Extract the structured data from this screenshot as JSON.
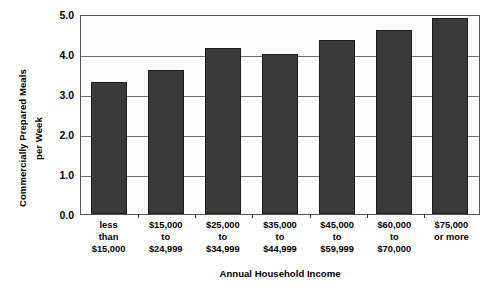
{
  "chart_data": {
    "type": "bar",
    "title": "",
    "xlabel": "Annual Household Income",
    "ylabel": "Commercially Prepared Meals per Week",
    "ylabel_lines": [
      "Commercially Prepared",
      "Meals per Week"
    ],
    "ylabel_line1": "Commercially Prepared Meals",
    "ylabel_line2": "per Week",
    "ylim": [
      0.0,
      5.0
    ],
    "yticks": [
      "0.0",
      "1.0",
      "2.0",
      "3.0",
      "4.0",
      "5.0"
    ],
    "ytick_values": [
      0.0,
      1.0,
      2.0,
      3.0,
      4.0,
      5.0
    ],
    "grid": true,
    "legend": "none",
    "bar_color": "#3a3a3a",
    "categories": [
      "less than $15,000",
      "$15,000 to $24,999",
      "$25,000 to $34,999",
      "$35,000 to $44,999",
      "$45,000 to $59,999",
      "$60,000 to $70,000",
      "$75,000 or more"
    ],
    "category_lines": [
      [
        "less",
        "than",
        "$15,000"
      ],
      [
        "$15,000",
        "to",
        "$24,999"
      ],
      [
        "$25,000",
        "to",
        "$34,999"
      ],
      [
        "$35,000",
        "to",
        "$44,999"
      ],
      [
        "$45,000",
        "to",
        "$59,999"
      ],
      [
        "$60,000",
        "to",
        "$70,000"
      ],
      [
        "$75,000",
        "or more",
        ""
      ]
    ],
    "values": [
      3.3,
      3.6,
      4.15,
      4.0,
      4.35,
      4.6,
      4.9
    ]
  }
}
